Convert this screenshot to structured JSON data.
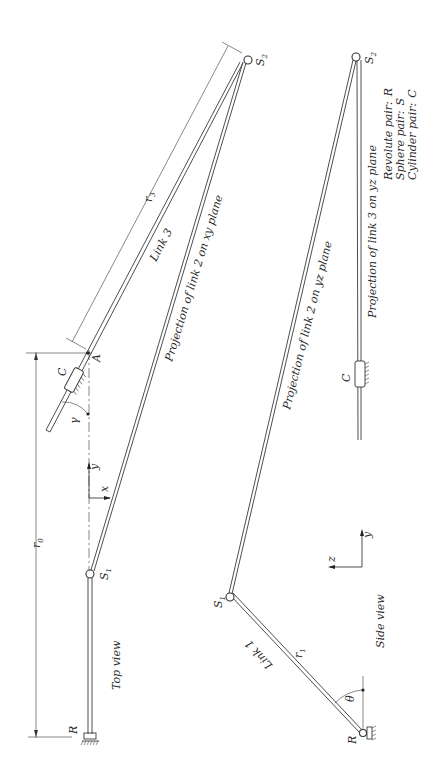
{
  "figure": {
    "orientation": "rotated 90 degrees counter-clockwise",
    "views": {
      "top_view": {
        "title": "Top view",
        "axes": {
          "x": "x",
          "y": "y"
        },
        "labels": {
          "R": "R",
          "S1": "S",
          "S1_sub": "1",
          "S2": "S",
          "S2_sub": "2",
          "A": "A",
          "C": "C",
          "gamma": "γ",
          "r0": "r",
          "r0_sub": "0",
          "r3": "r",
          "r3_sub": "3",
          "link3": "Link 3",
          "proj_link2": "Projection of link 2 on xy plane"
        }
      },
      "side_view": {
        "title": "Side view",
        "axes": {
          "z": "z",
          "y": "y"
        },
        "labels": {
          "R": "R",
          "S1": "S",
          "S1_sub": "1",
          "S2": "S",
          "S2_sub": "2",
          "C": "C",
          "theta": "θ",
          "r1": "r",
          "r1_sub": "1",
          "link1": "Link 1",
          "proj_link2": "Projection of link 2 on yz plane",
          "proj_link3": "Projection of link 3 on yz plane"
        }
      }
    },
    "legend": [
      {
        "label": "Revolute pair:",
        "symbol": "R"
      },
      {
        "label": "Sphere pair:",
        "symbol": "S"
      },
      {
        "label": "Cylinder pair:",
        "symbol": "C"
      }
    ]
  }
}
